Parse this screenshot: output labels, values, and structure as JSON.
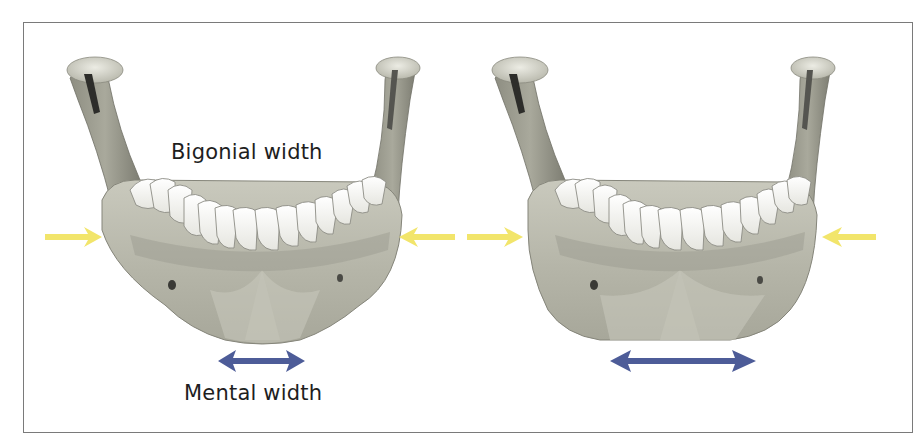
{
  "figure": {
    "labels": {
      "bigonial": "Bigonial width",
      "mental": "Mental width"
    },
    "panels": [
      {
        "id": "left",
        "jaw": "mandible-narrow-chin",
        "bigonial_arrows": "inward",
        "mental_arrow": "short"
      },
      {
        "id": "right",
        "jaw": "mandible-wide-chin",
        "bigonial_arrows": "inward",
        "mental_arrow": "long"
      }
    ],
    "colors": {
      "bigonial_arrow": "#f2e56b",
      "mental_arrow": "#4d5c98",
      "bone_light": "#d8d8cc",
      "bone_mid": "#b3b3a6",
      "bone_dark": "#7d7d72",
      "teeth": "#f7f7f4",
      "frame_border": "#7a7a7a",
      "text": "#1e1e1e"
    }
  }
}
